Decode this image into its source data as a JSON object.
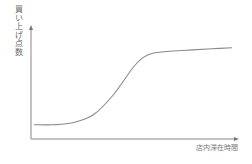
{
  "chart_data": {
    "type": "line",
    "title": "",
    "xlabel": "店内滞在時間",
    "ylabel": "買い上げ点数",
    "grid": false,
    "legend": null,
    "ticks": {
      "x": [],
      "y": []
    },
    "shape": "sigmoid (S-curve)",
    "xlim": [
      0,
      100
    ],
    "ylim": [
      0,
      100
    ],
    "series": [
      {
        "name": "買い上げ点数",
        "x": [
          0,
          10,
          20,
          30,
          40,
          50,
          55,
          60,
          70,
          80,
          90,
          100
        ],
        "values": [
          13,
          13,
          15,
          22,
          40,
          65,
          74,
          78,
          80,
          81,
          82,
          83
        ]
      }
    ],
    "colors": {
      "axis": "#888888",
      "line": "#8a8a8a"
    }
  }
}
